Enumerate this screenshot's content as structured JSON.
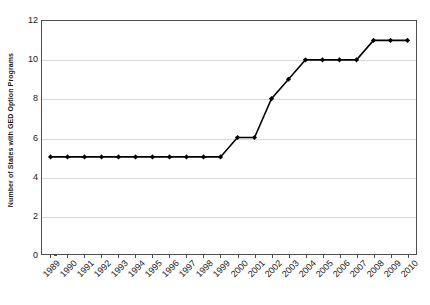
{
  "chart_data": {
    "type": "line",
    "title": "",
    "subtitle": "",
    "xlabel": "",
    "ylabel": "Number of States with GED Option Programs",
    "categories": [
      "1989",
      "1990",
      "1991",
      "1992",
      "1993",
      "1994",
      "1995",
      "1996",
      "1997",
      "1998",
      "1999",
      "2000",
      "2001",
      "2002",
      "2003",
      "2004",
      "2005",
      "2006",
      "2007",
      "2008",
      "2009",
      "2010"
    ],
    "values": [
      5,
      5,
      5,
      5,
      5,
      5,
      5,
      5,
      5,
      5,
      5,
      6,
      6,
      8,
      9,
      10,
      10,
      10,
      10,
      11,
      11,
      11
    ],
    "series": [
      {
        "name": "Number of States with GED Option Programs",
        "values": [
          5,
          5,
          5,
          5,
          5,
          5,
          5,
          5,
          5,
          5,
          5,
          6,
          6,
          8,
          9,
          10,
          10,
          10,
          10,
          11,
          11,
          11
        ]
      }
    ],
    "ylim": [
      0,
      12
    ],
    "y_ticks": [
      0,
      2,
      4,
      6,
      8,
      10,
      12
    ],
    "y_tick_labels": [
      "0",
      "2",
      "4",
      "6",
      "8",
      "10",
      "12"
    ],
    "grid": "horizontal",
    "legend": "none",
    "marker": "diamond",
    "line_color": "#000000",
    "marker_color": "#000000",
    "grid_color": "#d9d9d9",
    "axis_color": "#4d4d4d",
    "background_color": "#ffffff",
    "x_tick_rotation": -45,
    "annotations": []
  }
}
